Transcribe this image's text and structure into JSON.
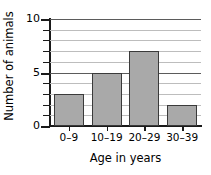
{
  "chart_data": {
    "type": "bar",
    "title": "",
    "subtitle": "",
    "xlabel": "Age in years",
    "ylabel": "Number of animals",
    "categories": [
      "0–9",
      "10–19",
      "20–29",
      "30–39"
    ],
    "values": [
      3,
      5,
      7,
      2
    ],
    "ylim": [
      0,
      10
    ],
    "ytick_interval": 1,
    "ytick_labeled": [
      0,
      5,
      10
    ],
    "ytick_labels": [
      "0",
      "5",
      "10"
    ],
    "grid": true,
    "grid_orientation": "horizontal",
    "legend": null,
    "legend_position": "none",
    "bar_fill_color": "#a9a9a9",
    "bar_edge_color": "#3a3a3a",
    "axis_color": "#1a1a1a",
    "gridline_color": "#5b5b5b",
    "background_color": "#ffffff"
  }
}
